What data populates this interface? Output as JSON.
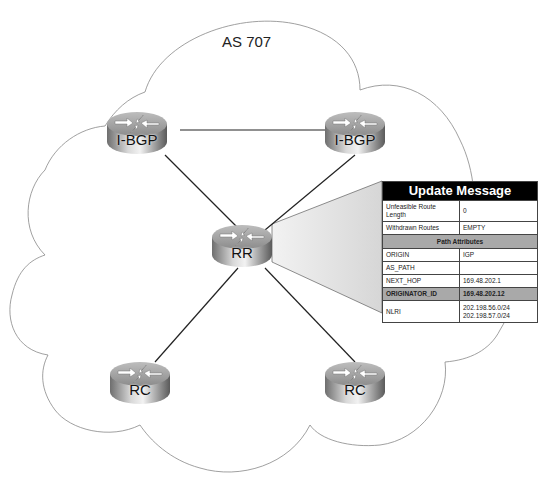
{
  "diagram": {
    "as_label": "AS 707",
    "routers": [
      {
        "id": "ibgp-left",
        "label": "I-BGP"
      },
      {
        "id": "ibgp-right",
        "label": "I-BGP"
      },
      {
        "id": "rr",
        "label": "RR"
      },
      {
        "id": "rc-left",
        "label": "RC"
      },
      {
        "id": "rc-right",
        "label": "RC"
      }
    ],
    "links": [
      [
        "ibgp-left",
        "ibgp-right"
      ],
      [
        "ibgp-left",
        "rr"
      ],
      [
        "ibgp-right",
        "rr"
      ],
      [
        "rr",
        "rc-left"
      ],
      [
        "rr",
        "rc-right"
      ]
    ],
    "update_message": {
      "title": "Update Message",
      "rows": [
        {
          "field": "Unfeasible Route Length",
          "value": "0"
        },
        {
          "field": "Withdrawn Routes",
          "value": "EMPTY"
        }
      ],
      "section_title": "Path Attributes",
      "attributes": [
        {
          "field": "ORIGIN",
          "value": "IGP"
        },
        {
          "field": "AS_PATH",
          "value": ""
        },
        {
          "field": "NEXT_HOP",
          "value": "169.48.202.1"
        },
        {
          "field": "ORIGINATOR_ID",
          "value": "169.48.202.12",
          "highlight": true
        }
      ],
      "nlri": {
        "field": "NLRI",
        "values": [
          "202.198.56.0/24",
          "202.198.57.0/24"
        ]
      }
    }
  }
}
